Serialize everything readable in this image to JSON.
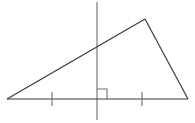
{
  "figure": {
    "canvas": {
      "width": 195,
      "height": 123,
      "background": "#ffffff"
    },
    "stroke_color": "#3a3a3a",
    "tick_color": "#6e6e6e",
    "right_angle_color": "#6e6e6e",
    "stroke_width": 1.1
  },
  "triangle": {
    "name": "scalene-triangle",
    "vertices": {
      "left": {
        "x": 7,
        "y": 99
      },
      "apex": {
        "x": 145,
        "y": 19
      },
      "right": {
        "x": 188,
        "y": 99
      }
    },
    "sides": [
      {
        "name": "base",
        "from": "left",
        "to": "right"
      },
      {
        "name": "left-slanted-side",
        "from": "left",
        "to": "apex"
      },
      {
        "name": "right-slanted-side",
        "from": "apex",
        "to": "right"
      }
    ]
  },
  "vertical_line": {
    "name": "perpendicular-line",
    "x": 97,
    "y_top": 2,
    "y_bottom": 120,
    "crosses_left_side_at_y": 48,
    "foot_on_base_at": {
      "x": 97,
      "y": 99
    }
  },
  "right_angle_marker": {
    "name": "right-angle-square",
    "x": 97,
    "y": 89,
    "size": 10,
    "side": "right"
  },
  "tick_marks": [
    {
      "name": "tick-mark-left",
      "x": 52,
      "y_top": 92,
      "y_bottom": 106
    },
    {
      "name": "tick-mark-right",
      "x": 142,
      "y_top": 92,
      "y_bottom": 106
    }
  ]
}
